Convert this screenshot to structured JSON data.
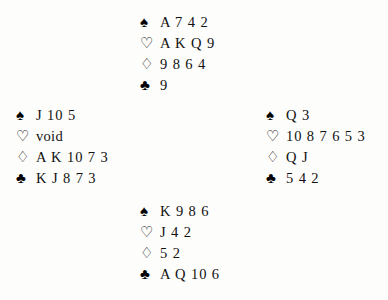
{
  "diagram": {
    "type": "bridge-deal",
    "suit_symbols": {
      "spades": "♠",
      "hearts": "♡",
      "diamonds": "♢",
      "clubs": "♣"
    },
    "hands": {
      "north": {
        "position": "North",
        "suits": [
          {
            "suit": "spades",
            "symbol": "♠",
            "style": "filled",
            "cards": "A 7 4 2"
          },
          {
            "suit": "hearts",
            "symbol": "♡",
            "style": "hollow",
            "cards": "A K Q 9"
          },
          {
            "suit": "diamonds",
            "symbol": "♢",
            "style": "hollow",
            "cards": "9 8 6 4"
          },
          {
            "suit": "clubs",
            "symbol": "♣",
            "style": "filled",
            "cards": "9"
          }
        ]
      },
      "west": {
        "position": "West",
        "suits": [
          {
            "suit": "spades",
            "symbol": "♠",
            "style": "filled",
            "cards": "J 10 5"
          },
          {
            "suit": "hearts",
            "symbol": "♡",
            "style": "hollow",
            "cards": "void"
          },
          {
            "suit": "diamonds",
            "symbol": "♢",
            "style": "hollow",
            "cards": "A K 10 7 3"
          },
          {
            "suit": "clubs",
            "symbol": "♣",
            "style": "filled",
            "cards": "K J 8 7 3"
          }
        ]
      },
      "east": {
        "position": "East",
        "suits": [
          {
            "suit": "spades",
            "symbol": "♠",
            "style": "filled",
            "cards": "Q 3"
          },
          {
            "suit": "hearts",
            "symbol": "♡",
            "style": "hollow",
            "cards": "10 8 7 6 5 3"
          },
          {
            "suit": "diamonds",
            "symbol": "♢",
            "style": "hollow",
            "cards": "Q J"
          },
          {
            "suit": "clubs",
            "symbol": "♣",
            "style": "filled",
            "cards": "5 4 2"
          }
        ]
      },
      "south": {
        "position": "South",
        "suits": [
          {
            "suit": "spades",
            "symbol": "♠",
            "style": "filled",
            "cards": "K 9 8 6"
          },
          {
            "suit": "hearts",
            "symbol": "♡",
            "style": "hollow",
            "cards": "J 4 2"
          },
          {
            "suit": "diamonds",
            "symbol": "♢",
            "style": "hollow",
            "cards": "5 2"
          },
          {
            "suit": "clubs",
            "symbol": "♣",
            "style": "filled",
            "cards": "A Q 10 6"
          }
        ]
      }
    }
  }
}
